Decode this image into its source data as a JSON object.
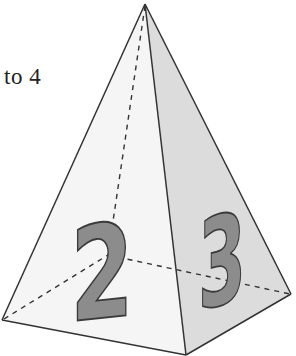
{
  "caption": {
    "text": "to 4"
  },
  "figure": {
    "shape": "square-pyramid",
    "faces": [
      {
        "name": "left-face",
        "label": "2",
        "fill": "#f5f5f5"
      },
      {
        "name": "right-face",
        "label": "3",
        "fill": "#dcdcdc"
      }
    ],
    "colors": {
      "edge": "#333333",
      "hidden_edge": "#333333",
      "digit_fill": "#8c8c8c",
      "digit_stroke": "#3a3a3a"
    }
  }
}
